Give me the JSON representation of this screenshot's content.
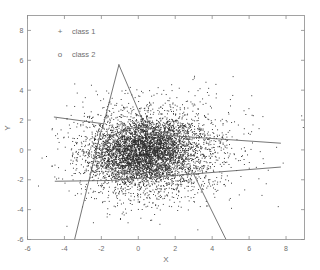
{
  "figure": {
    "name": "scatter-plot-two-class",
    "background_color": "#ffffff",
    "foreground_color": "#6e6e6e",
    "point_color": "#2b2b2b",
    "boundary_color": "#5d5d5d"
  },
  "legend": {
    "position": "top-left-inside",
    "entries": [
      {
        "marker": "+",
        "marker_name": "plus-marker",
        "label": "class 1"
      },
      {
        "marker": "o",
        "marker_name": "circle-marker",
        "label": "class 2"
      }
    ]
  },
  "axes": {
    "x_title": "X",
    "y_title": "Y",
    "x_ticks": [
      "-6",
      "-4",
      "-2",
      "0",
      "2",
      "4",
      "6",
      "8"
    ],
    "y_ticks": [
      "8",
      "6",
      "4",
      "2",
      "0",
      "-2",
      "-4",
      "-6"
    ]
  },
  "chart_data": {
    "type": "scatter",
    "title": "",
    "xlabel": "X",
    "ylabel": "Y",
    "xlim": [
      -6,
      9
    ],
    "ylim": [
      -6,
      9
    ],
    "xticks": [
      -6,
      -4,
      -2,
      0,
      2,
      4,
      6,
      8
    ],
    "yticks": [
      -6,
      -4,
      -2,
      0,
      2,
      4,
      6,
      8
    ],
    "grid": false,
    "legend_position": "upper left",
    "series": [
      {
        "name": "class 1",
        "marker": "+",
        "color": "#2b2b2b",
        "n_points": 3200,
        "distribution": "gaussian",
        "mean": [
          0.2,
          -0.1
        ],
        "std": [
          1.35,
          1.05
        ],
        "correlation": 0.1
      },
      {
        "name": "class 2",
        "marker": "o",
        "color": "#2b2b2b",
        "n_points": 2400,
        "distribution": "gaussian",
        "mean": [
          0.9,
          -0.2
        ],
        "std": [
          2.1,
          1.7
        ],
        "correlation": 0.05
      }
    ],
    "annotations": [
      {
        "name": "ellipse-decision-boundary",
        "kind": "ellipse",
        "center": [
          -0.05,
          -0.05
        ],
        "rx": 1.95,
        "ry": 1.55,
        "rotation_deg": -8
      },
      {
        "name": "upper-left-line",
        "kind": "polyline",
        "points": [
          [
            -4.55,
            2.2
          ],
          [
            -1.9,
            1.75
          ]
        ]
      },
      {
        "name": "lower-left-line",
        "kind": "polyline",
        "points": [
          [
            -4.5,
            -2.1
          ],
          [
            -1.55,
            -2.05
          ]
        ]
      },
      {
        "name": "tent-left-edge",
        "kind": "polyline",
        "points": [
          [
            -1.05,
            5.7
          ],
          [
            -1.95,
            1.4
          ]
        ]
      },
      {
        "name": "tent-right-edge",
        "kind": "polyline",
        "points": [
          [
            -1.05,
            5.7
          ],
          [
            0.55,
            1.05
          ]
        ]
      },
      {
        "name": "right-upper-line",
        "kind": "polyline",
        "points": [
          [
            0.6,
            1.05
          ],
          [
            7.7,
            0.45
          ]
        ]
      },
      {
        "name": "right-lower-line",
        "kind": "polyline",
        "points": [
          [
            -1.5,
            -2.05
          ],
          [
            7.7,
            -1.15
          ]
        ]
      },
      {
        "name": "bottom-left-steep-line",
        "kind": "polyline",
        "points": [
          [
            -2.0,
            1.35
          ],
          [
            -3.45,
            -6.0
          ]
        ]
      },
      {
        "name": "bottom-right-steep-line",
        "kind": "polyline",
        "points": [
          [
            2.95,
            -1.5
          ],
          [
            4.75,
            -6.0
          ]
        ]
      }
    ]
  }
}
